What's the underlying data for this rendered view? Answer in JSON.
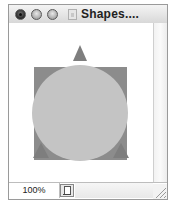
{
  "window": {
    "title": "Shapes....",
    "buttons": [
      "close",
      "minimize",
      "zoom"
    ],
    "document_icon": "document-icon"
  },
  "canvas": {
    "shapes": [
      {
        "kind": "square",
        "name": "dark-square",
        "color": "#8c8c8c"
      },
      {
        "kind": "triangle",
        "name": "top-triangle",
        "color": "#7e7e7e"
      },
      {
        "kind": "triangle",
        "name": "bottom-left-triangle",
        "color": "#7e7e7e"
      },
      {
        "kind": "triangle",
        "name": "bottom-right-triangle",
        "color": "#7e7e7e"
      },
      {
        "kind": "circle",
        "name": "light-circle",
        "color": "#c4c4c4"
      }
    ]
  },
  "statusbar": {
    "zoom_level": "100%",
    "page_icon": "page-icon"
  }
}
